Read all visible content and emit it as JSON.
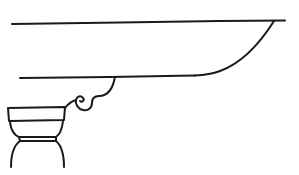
{
  "figure": {
    "kind": "line-drawing",
    "stroke_color": "#1a1a1a",
    "background": "#ffffff"
  }
}
